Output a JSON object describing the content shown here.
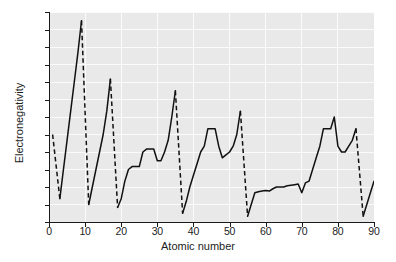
{
  "chart_data": {
    "type": "line",
    "title": "",
    "xlabel": "Atomic number",
    "ylabel": "Electronegativity",
    "xlim": [
      0,
      90
    ],
    "ylim": [
      0.6,
      4.2
    ],
    "xticks": [
      0,
      10,
      20,
      30,
      40,
      50,
      60,
      70,
      80,
      90
    ],
    "yticks": [
      0.6,
      0.9,
      1.2,
      1.5,
      1.8,
      2.1,
      2.4,
      2.7,
      3.0,
      3.3,
      3.6,
      3.9,
      4.2
    ],
    "xtick_labels": [
      "0",
      "10",
      "20",
      "30",
      "40",
      "50",
      "60",
      "70",
      "80",
      "90"
    ],
    "ytick_labels": [
      "0.6",
      "0.9",
      "1.2",
      "1.5",
      "1.8",
      "2.1",
      "2.4",
      "2.7",
      "3.0",
      "3.3",
      "3.6",
      "3.9",
      "4.2"
    ],
    "grid": true,
    "legend": "none",
    "line_color": "#111111",
    "plot_background": "#e9e9e9",
    "gridline_color": "#fbfbfb",
    "series": [
      {
        "name": "Pauling electronegativity",
        "style_solid_within_period": true,
        "style_dashed_between_periods": true,
        "x": [
          1,
          3,
          4,
          5,
          6,
          7,
          8,
          9,
          11,
          12,
          13,
          14,
          15,
          16,
          17,
          19,
          20,
          21,
          22,
          23,
          24,
          25,
          26,
          27,
          28,
          29,
          30,
          31,
          32,
          33,
          34,
          35,
          37,
          38,
          39,
          40,
          41,
          42,
          43,
          44,
          45,
          46,
          47,
          48,
          49,
          50,
          51,
          52,
          53,
          55,
          56,
          57,
          58,
          59,
          60,
          61,
          62,
          63,
          64,
          65,
          66,
          67,
          68,
          69,
          70,
          71,
          72,
          73,
          74,
          75,
          76,
          77,
          78,
          79,
          80,
          81,
          82,
          83,
          84,
          85,
          87,
          88,
          89,
          90
        ],
        "y": [
          2.1,
          1.0,
          1.5,
          2.0,
          2.5,
          3.0,
          3.5,
          4.05,
          0.9,
          1.2,
          1.5,
          1.8,
          2.1,
          2.5,
          3.05,
          0.85,
          1.0,
          1.3,
          1.5,
          1.55,
          1.55,
          1.55,
          1.8,
          1.85,
          1.85,
          1.85,
          1.65,
          1.65,
          1.8,
          2.0,
          2.4,
          2.85,
          0.75,
          0.95,
          1.2,
          1.4,
          1.6,
          1.8,
          1.9,
          2.2,
          2.2,
          2.2,
          1.9,
          1.7,
          1.75,
          1.8,
          1.9,
          2.1,
          2.5,
          0.7,
          0.9,
          1.1,
          1.12,
          1.13,
          1.14,
          1.13,
          1.17,
          1.2,
          1.2,
          1.2,
          1.22,
          1.23,
          1.24,
          1.25,
          1.1,
          1.27,
          1.3,
          1.5,
          1.7,
          1.9,
          2.2,
          2.2,
          2.2,
          2.4,
          1.9,
          1.8,
          1.8,
          1.9,
          2.0,
          2.2,
          0.7,
          0.9,
          1.1,
          1.3
        ],
        "dashed_links": [
          {
            "from_x": 1,
            "from_y": 2.1,
            "to_x": 3,
            "to_y": 1.0
          },
          {
            "from_x": 9,
            "from_y": 4.05,
            "to_x": 11,
            "to_y": 0.9
          },
          {
            "from_x": 17,
            "from_y": 3.05,
            "to_x": 19,
            "to_y": 0.85
          },
          {
            "from_x": 35,
            "from_y": 2.85,
            "to_x": 37,
            "to_y": 0.75
          },
          {
            "from_x": 53,
            "from_y": 2.5,
            "to_x": 55,
            "to_y": 0.7
          },
          {
            "from_x": 85,
            "from_y": 2.2,
            "to_x": 87,
            "to_y": 0.7
          }
        ]
      }
    ]
  }
}
